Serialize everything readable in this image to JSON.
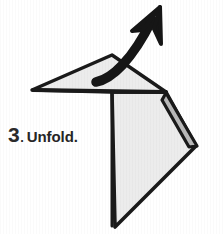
{
  "figure": {
    "kind": "origami-instruction-diagram",
    "step_number": "3",
    "step_period": ".",
    "instruction": "Unfold.",
    "colors": {
      "background": "#ffffff",
      "paper_fill": "#ececec",
      "paper_shadow_fill": "#b9b9b9",
      "outline": "#1a1a1a",
      "arrow": "#161616",
      "text": "#262626"
    },
    "paper": {
      "top_flap_name": "upper-triangular-flap",
      "body_name": "lower-paper-body",
      "sliver_name": "right-edge-fold-sliver",
      "top_flap_points": "32,90 112,55 166,92 112,92",
      "body_points": "112,92 166,92 196,146 115,227",
      "sliver_points": "166,92 196,146 190,146 163,99",
      "crease_line": "112,92 166,92",
      "vertical_crease": "112,92 112,227"
    },
    "arrow": {
      "name": "unfold-direction-arrow",
      "tail": "96,82",
      "tip": "160,8",
      "stroke_width": "9",
      "head_left_barb": "133,30",
      "head_right_barb": "163,42",
      "description": "thick curved arrow pointing up and to the right"
    }
  }
}
